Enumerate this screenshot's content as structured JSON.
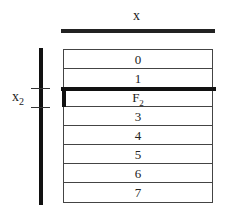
{
  "labels": {
    "top_axis": "x",
    "side_axis_base": "x",
    "side_axis_sub": "2"
  },
  "rows": [
    {
      "label": "0",
      "sub": ""
    },
    {
      "label": "1",
      "sub": ""
    },
    {
      "label": "F",
      "sub": "2"
    },
    {
      "label": "3",
      "sub": ""
    },
    {
      "label": "4",
      "sub": ""
    },
    {
      "label": "5",
      "sub": ""
    },
    {
      "label": "6",
      "sub": ""
    },
    {
      "label": "7",
      "sub": ""
    }
  ],
  "colors": {
    "line": "#111111",
    "border": "#444444",
    "background": "#ffffff"
  }
}
